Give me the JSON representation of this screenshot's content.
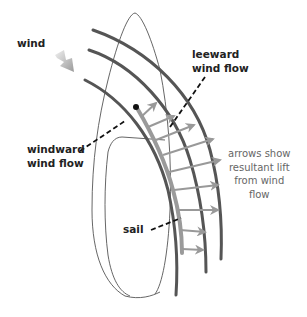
{
  "diagram": {
    "labels": {
      "wind": "wind",
      "leeward_line1": "leeward",
      "leeward_line2": "wind flow",
      "windward_line1": "windward",
      "windward_line2": "wind flow",
      "sail": "sail"
    },
    "note": {
      "line1": "arrows show",
      "line2": "resultant lift",
      "line3": "from wind",
      "line4": "flow"
    },
    "icons": {
      "wind_direction": "gradient-arrow-icon",
      "lift": "lift-arrow-icon"
    },
    "colors": {
      "flow_line": "#555555",
      "sail_curve": "#9a9a9a",
      "lift_arrow": "#999999",
      "outline": "#555555",
      "leader": "#111111",
      "label_text": "#222222",
      "note_text": "#666666"
    }
  }
}
